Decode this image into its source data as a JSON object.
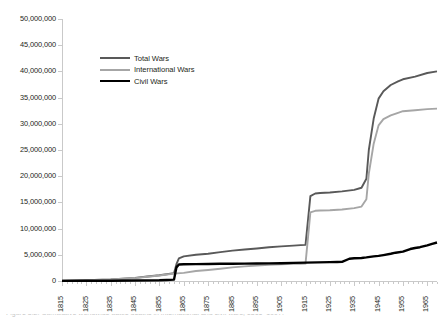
{
  "chart_data": {
    "type": "line",
    "title": "",
    "subtitle": "",
    "xlabel": "",
    "ylabel": "",
    "grid": false,
    "legend_position": "inside-top-left",
    "xlim": [
      1815,
      1969
    ],
    "ylim": [
      0,
      50000000
    ],
    "y_ticks": [
      "0",
      "5,000,000",
      "10,000,000",
      "15,000,000",
      "20,000,000",
      "25,000,000",
      "30,000,000",
      "35,000,000",
      "40,000,000",
      "45,000,000",
      "50,000,000"
    ],
    "y_tick_values": [
      0,
      5000000,
      10000000,
      15000000,
      20000000,
      25000000,
      30000000,
      35000000,
      40000000,
      45000000,
      50000000
    ],
    "x_ticks": [
      "1815",
      "1825",
      "1835",
      "1845",
      "1855",
      "1865",
      "1875",
      "1885",
      "1895",
      "1905",
      "1915",
      "1925",
      "1935",
      "1945",
      "1955",
      "1965"
    ],
    "x_tick_values": [
      1815,
      1825,
      1835,
      1845,
      1855,
      1865,
      1875,
      1885,
      1895,
      1905,
      1915,
      1925,
      1935,
      1945,
      1955,
      1965
    ],
    "series": [
      {
        "name": "Total Wars",
        "color": "#595959",
        "stroke_width": 1.9,
        "x": [
          1815,
          1825,
          1835,
          1845,
          1850,
          1855,
          1858,
          1861,
          1862,
          1863,
          1865,
          1870,
          1875,
          1880,
          1885,
          1890,
          1895,
          1900,
          1905,
          1910,
          1913,
          1915,
          1917,
          1919,
          1921,
          1925,
          1930,
          1935,
          1938,
          1940,
          1941,
          1943,
          1945,
          1947,
          1950,
          1953,
          1955,
          1960,
          1965,
          1969
        ],
        "values": [
          60000,
          150000,
          300000,
          600000,
          850000,
          1100000,
          1300000,
          1500000,
          3200000,
          4300000,
          4700000,
          5000000,
          5200000,
          5500000,
          5800000,
          6000000,
          6200000,
          6450000,
          6600000,
          6750000,
          6850000,
          6900000,
          16200000,
          16700000,
          16800000,
          16900000,
          17100000,
          17400000,
          17800000,
          19500000,
          25000000,
          31000000,
          34800000,
          36200000,
          37400000,
          38100000,
          38500000,
          39000000,
          39700000,
          40000000
        ]
      },
      {
        "name": "International Wars",
        "color": "#a6a6a6",
        "stroke_width": 1.9,
        "x": [
          1815,
          1825,
          1835,
          1845,
          1850,
          1855,
          1858,
          1861,
          1865,
          1870,
          1875,
          1880,
          1885,
          1890,
          1895,
          1900,
          1905,
          1910,
          1913,
          1915,
          1917,
          1919,
          1921,
          1925,
          1930,
          1935,
          1938,
          1940,
          1941,
          1943,
          1945,
          1947,
          1950,
          1953,
          1955,
          1960,
          1965,
          1969
        ],
        "values": [
          50000,
          130000,
          280000,
          560000,
          800000,
          1050000,
          1250000,
          1400000,
          1550000,
          1900000,
          2100000,
          2350000,
          2600000,
          2800000,
          2950000,
          3080000,
          3180000,
          3260000,
          3300000,
          3320000,
          13100000,
          13400000,
          13450000,
          13500000,
          13650000,
          13900000,
          14200000,
          15600000,
          20500000,
          26200000,
          29700000,
          30900000,
          31600000,
          32100000,
          32400000,
          32600000,
          32800000,
          32900000
        ]
      },
      {
        "name": "Civil Wars",
        "color": "#000000",
        "stroke_width": 2.4,
        "x": [
          1815,
          1825,
          1835,
          1845,
          1855,
          1858,
          1861,
          1862,
          1863,
          1865,
          1870,
          1875,
          1880,
          1885,
          1890,
          1895,
          1900,
          1905,
          1910,
          1915,
          1920,
          1925,
          1928,
          1930,
          1933,
          1935,
          1938,
          1940,
          1943,
          1945,
          1947,
          1950,
          1952,
          1955,
          1958,
          1960,
          1962,
          1965,
          1967,
          1969
        ],
        "values": [
          20000,
          40000,
          60000,
          90000,
          140000,
          200000,
          260000,
          2600000,
          3150000,
          3200000,
          3220000,
          3250000,
          3280000,
          3300000,
          3320000,
          3340000,
          3360000,
          3400000,
          3450000,
          3500000,
          3560000,
          3600000,
          3620000,
          3650000,
          4250000,
          4350000,
          4400000,
          4500000,
          4700000,
          4800000,
          4950000,
          5200000,
          5400000,
          5600000,
          6100000,
          6300000,
          6450000,
          6800000,
          7100000,
          7350000
        ]
      }
    ],
    "annotations": []
  },
  "legend": {
    "items": [
      {
        "label": "Total Wars",
        "color": "#595959",
        "width": 2.2
      },
      {
        "label": "International Wars",
        "color": "#a6a6a6",
        "width": 2.2
      },
      {
        "label": "Civil Wars",
        "color": "#000000",
        "width": 2.8
      }
    ]
  },
  "caption": {
    "text": "Figure 3.2. Cumulative worldwide battle deaths in international and civil wars, 1816–1997."
  }
}
